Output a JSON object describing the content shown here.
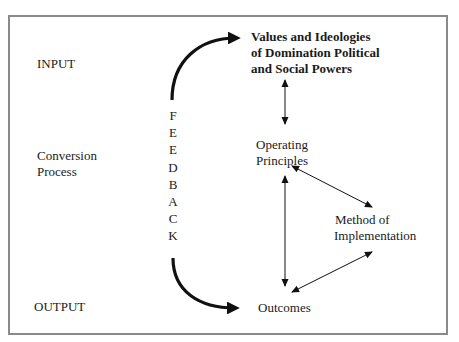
{
  "diagram": {
    "stages": {
      "input": "INPUT",
      "conversion_line1": "Conversion",
      "conversion_line2": "Process",
      "output": "OUTPUT"
    },
    "feedback_letters": [
      "F",
      "E",
      "E",
      "D",
      "B",
      "A",
      "C",
      "K"
    ],
    "nodes": {
      "values": {
        "line1": "Values and Ideologies",
        "line2": "of Domination Political",
        "line3": "and Social Powers"
      },
      "principles": {
        "line1": "Operating",
        "line2": "Principles"
      },
      "method": {
        "line1": "Method of",
        "line2": "Implementation"
      },
      "outcomes": {
        "line1": "Outcomes"
      }
    },
    "edges": [
      {
        "from": "feedback",
        "to": "values",
        "type": "curved-thick"
      },
      {
        "from": "feedback",
        "to": "outcomes",
        "type": "curved-thick"
      },
      {
        "from": "values",
        "to": "principles",
        "type": "bidirectional"
      },
      {
        "from": "principles",
        "to": "outcomes",
        "type": "bidirectional"
      },
      {
        "from": "principles",
        "to": "method",
        "type": "bidirectional"
      },
      {
        "from": "method",
        "to": "outcomes",
        "type": "bidirectional"
      }
    ],
    "colors": {
      "frame": "#8a8a8a",
      "text": "#1a1a1a",
      "arrow": "#111111"
    }
  }
}
